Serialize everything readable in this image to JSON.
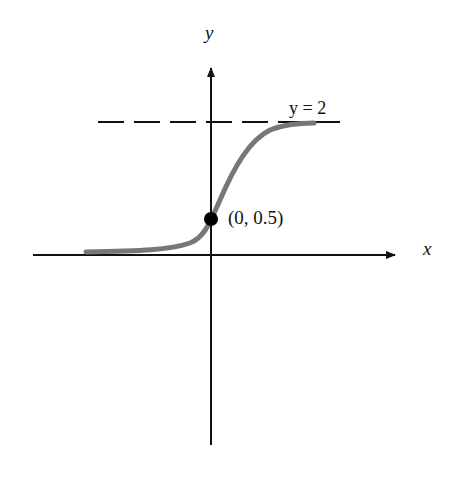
{
  "diagram": {
    "axes": {
      "x_label": "x",
      "y_label": "y"
    },
    "asymptote": {
      "label": "y = 2",
      "style": "dashed"
    },
    "point": {
      "label": "(0, 0.5)",
      "x": 0,
      "y": 0.5
    },
    "curve": {
      "type": "logistic",
      "color": "#777777",
      "lower_asymptote": 0,
      "upper_asymptote": 2,
      "y_intercept": 0.5
    },
    "colors": {
      "axis": "#111111",
      "curve": "#777777",
      "point": "#000000"
    }
  }
}
